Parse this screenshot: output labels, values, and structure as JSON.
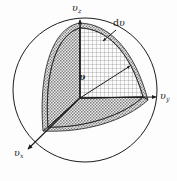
{
  "figure": {
    "kind": "velocity-space-octant-diagram",
    "background_color": "#fdfdfd",
    "ink_color": "#1c1c1c",
    "width": 177,
    "height": 181
  },
  "labels": {
    "axis_z": {
      "symbol": "υ",
      "subscript": "z"
    },
    "axis_y": {
      "symbol": "υ",
      "subscript": "y"
    },
    "axis_x": {
      "symbol": "υ",
      "subscript": "x"
    },
    "radius": {
      "text": "υ"
    },
    "shell_thickness": {
      "prefix": "d",
      "symbol": "υ"
    }
  },
  "geometry": {
    "origin": {
      "x": 80,
      "y": 98
    },
    "sphere": {
      "cx": 85,
      "cy": 90,
      "r": 72
    },
    "axis_z_tip": {
      "x": 80,
      "y": 18
    },
    "axis_y_tip": {
      "x": 157,
      "y": 97
    },
    "axis_x_tip": {
      "x": 27,
      "y": 150
    },
    "octant_z_vertex": {
      "x": 80,
      "y": 28
    },
    "octant_y_vertex": {
      "x": 143,
      "y": 97
    },
    "octant_x_vertex": {
      "x": 48,
      "y": 127
    },
    "shell_thickness_px": 5,
    "radius_arrow_start": {
      "x": 80,
      "y": 98
    },
    "radius_arrow_end": {
      "x": 131,
      "y": 66
    },
    "dv_leader_start": {
      "x": 115,
      "y": 29
    },
    "dv_leader_end": {
      "x": 104,
      "y": 40
    }
  },
  "styles": {
    "face_xz_fill": "#9a9a9a",
    "face_yz_fill": "#d8d8d8",
    "face_xy_fill": "#9a9a9a",
    "shell_band_fill": "#b4b4b4",
    "outline_color": "#1c1c1c",
    "sphere_stroke_width": 1.0,
    "edge_stroke_width": 0.9
  }
}
